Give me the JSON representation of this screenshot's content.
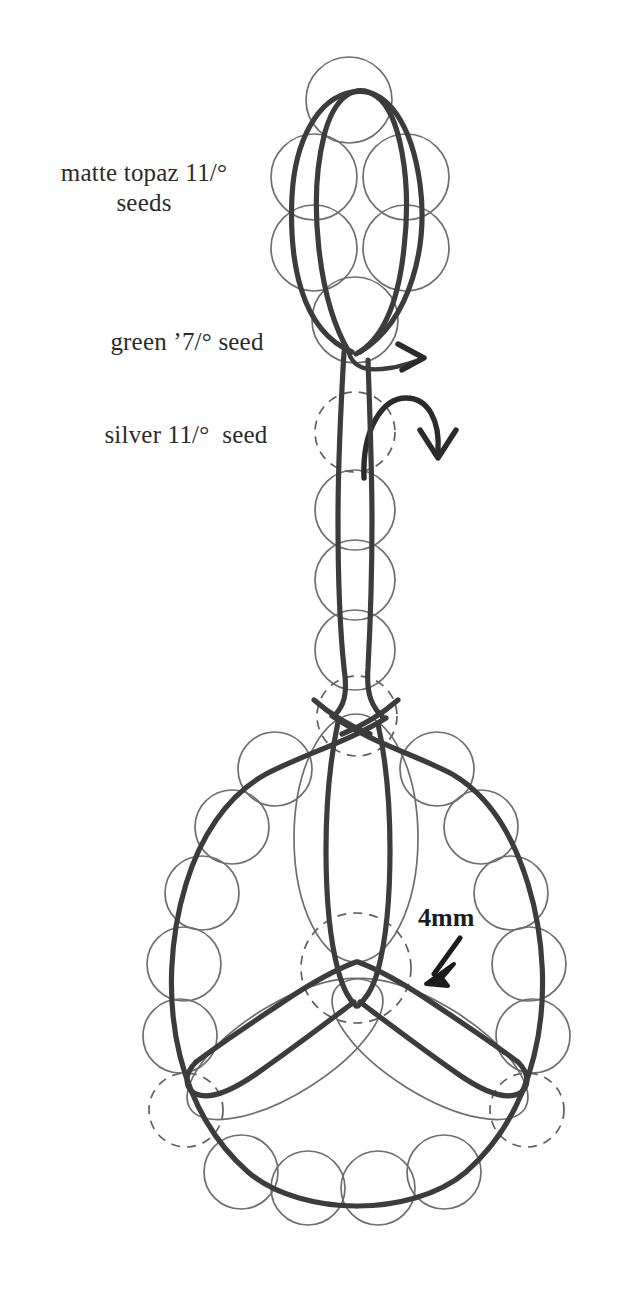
{
  "diagram": {
    "labels": [
      {
        "id": "matte-topaz",
        "text": "matte topaz 11/°\nseeds"
      },
      {
        "id": "green-seed",
        "text": "green ’7/° seed"
      },
      {
        "id": "silver-seed",
        "text": "silver 11/°  seed"
      }
    ],
    "annotations": [
      {
        "id": "bead-size",
        "text": "4mm"
      }
    ],
    "colors": {
      "background": "#ffffff",
      "thread": "#3c3c3c",
      "bead_outline": "#6e6e6e",
      "hidden_bead_outline": "#5f5f5f",
      "label_text": "#2b2b2b",
      "annotation_text": "#1c1c1c"
    },
    "legend": {
      "matte_topaz_label": "matte topaz 11/° seeds",
      "green_seed_label": "green ’7/° seed",
      "silver_seed_label": "silver 11/° seed",
      "bead_size_label": "4mm"
    },
    "arrows": [
      {
        "id": "thread-tail-arrow",
        "direction": "right"
      },
      {
        "id": "thread-path-arrow",
        "direction": "down"
      },
      {
        "id": "bead-size-arrow",
        "direction": "down-left"
      }
    ]
  }
}
